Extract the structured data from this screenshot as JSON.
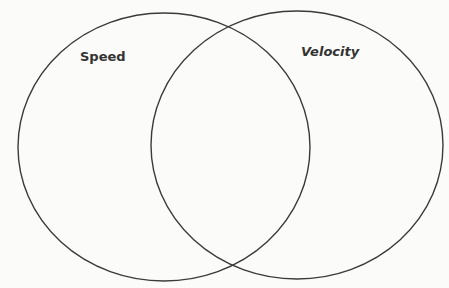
{
  "diagram": {
    "type": "venn",
    "background": "#fbfbfa",
    "stroke_color": "#3a3a3a",
    "sets": [
      {
        "label": "Speed",
        "cx": 164,
        "cy": 147,
        "rx": 146,
        "ry": 134,
        "label_x": 80,
        "label_y": 61
      },
      {
        "label": "Velocity",
        "cx": 297,
        "cy": 145,
        "rx": 146,
        "ry": 134,
        "label_x": 301,
        "label_y": 56
      }
    ],
    "intersection_label": ""
  }
}
